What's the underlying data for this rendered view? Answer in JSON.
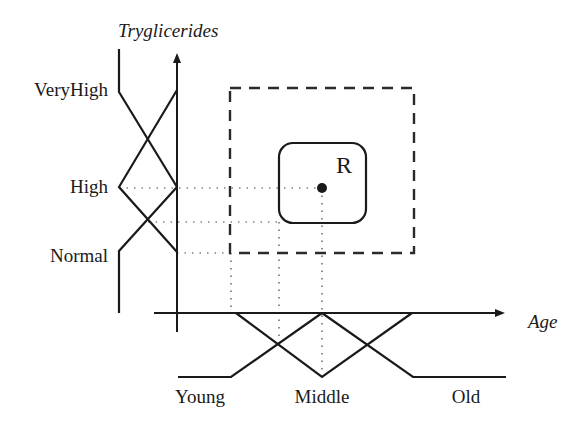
{
  "diagram": {
    "y_axis": {
      "label": "Tryglicerides"
    },
    "x_axis": {
      "label": "Age"
    },
    "y_fuzzy_sets": [
      {
        "name": "VeryHigh"
      },
      {
        "name": "High"
      },
      {
        "name": "Normal"
      }
    ],
    "x_fuzzy_sets": [
      {
        "name": "Young"
      },
      {
        "name": "Middle"
      },
      {
        "name": "Old"
      }
    ],
    "region": {
      "label": "R"
    },
    "colors": {
      "ink": "#1a1a1a",
      "background": "#ffffff"
    }
  }
}
